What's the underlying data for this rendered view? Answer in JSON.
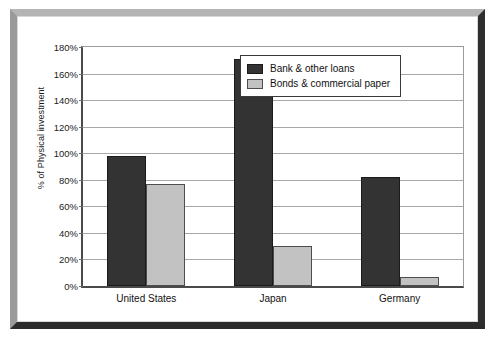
{
  "chart_data": {
    "type": "bar",
    "title": "",
    "subtitle": "",
    "xlabel": "",
    "ylabel": "% of Physical investment",
    "categories": [
      "United States",
      "Japan",
      "Germany"
    ],
    "series": [
      {
        "name": "Bank & other loans",
        "color": "#333333",
        "values": [
          98,
          171,
          82
        ]
      },
      {
        "name": "Bonds & commercial paper",
        "color": "#c2c2c2",
        "values": [
          77,
          30,
          7
        ]
      }
    ],
    "ylim": [
      0,
      180
    ],
    "ytick_step": 20,
    "ytick_labels": [
      "0%",
      "20%",
      "40%",
      "60%",
      "80%",
      "100%",
      "120%",
      "140%",
      "160%",
      "180%"
    ],
    "ytick_values": [
      0,
      20,
      40,
      60,
      80,
      100,
      120,
      140,
      160,
      180
    ],
    "grid": true,
    "grid_axis": "y",
    "legend_position": "upper right",
    "value_suffix": "%"
  },
  "frame": {
    "style": "beveled-border",
    "bevel_light": "#b4b4b4",
    "bevel_dark": "#2b2b2b"
  }
}
